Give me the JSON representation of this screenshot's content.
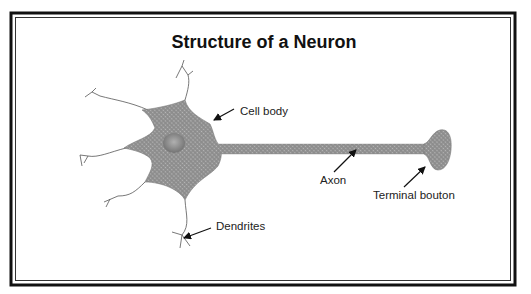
{
  "title": "Structure of a Neuron",
  "labels": {
    "cell_body": "Cell body",
    "axon": "Axon",
    "terminal_bouton": "Terminal bouton",
    "dendrites": "Dendrites"
  },
  "colors": {
    "cell_fill": "#8f8f8f",
    "cell_highlight": "#b5b5b5",
    "nucleus": "#7a7a7a",
    "frame": "#111111",
    "dendrite_stroke": "#555555"
  }
}
